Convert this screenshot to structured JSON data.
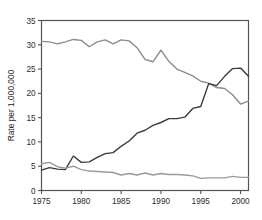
{
  "chart_data": {
    "type": "line",
    "title": "",
    "xlabel": "",
    "ylabel": "Rate per 1,000,000",
    "xlim": [
      1975,
      2001
    ],
    "ylim": [
      0,
      35
    ],
    "grid": false,
    "legend": "none",
    "x_ticks": [
      "1975",
      "1980",
      "1985",
      "1990",
      "1995",
      "2000"
    ],
    "x_tick_values": [
      1975,
      1980,
      1985,
      1990,
      1995,
      2000
    ],
    "y_ticks": [
      "0",
      "5",
      "10",
      "15",
      "20",
      "25",
      "30",
      "35"
    ],
    "y_tick_values": [
      0,
      5,
      10,
      15,
      20,
      25,
      30,
      35
    ],
    "x": [
      1975,
      1976,
      1977,
      1978,
      1979,
      1980,
      1981,
      1982,
      1983,
      1984,
      1985,
      1986,
      1987,
      1988,
      1989,
      1990,
      1991,
      1992,
      1993,
      1994,
      1995,
      1996,
      1997,
      1998,
      1999,
      2000,
      2001
    ],
    "series": [
      {
        "name": "declining-upper-series",
        "color": "#8c8c8c",
        "values": [
          30.7,
          30.6,
          30.2,
          30.6,
          31.1,
          30.9,
          29.6,
          30.6,
          31.0,
          30.2,
          31.0,
          30.8,
          29.4,
          27.0,
          26.5,
          28.9,
          26.6,
          25.0,
          24.3,
          23.6,
          22.5,
          22.1,
          21.2,
          21.0,
          19.7,
          17.8,
          18.4
        ]
      },
      {
        "name": "rising-series",
        "color": "#3a3a3a",
        "values": [
          4.2,
          4.7,
          4.4,
          4.3,
          7.1,
          5.8,
          5.9,
          6.8,
          7.6,
          7.8,
          9.1,
          10.2,
          11.8,
          12.4,
          13.4,
          14.0,
          14.8,
          14.8,
          15.1,
          16.9,
          17.3,
          22.0,
          21.6,
          23.5,
          25.1,
          25.2,
          23.5
        ]
      },
      {
        "name": "low-flat-series",
        "color": "#9a9a9a",
        "values": [
          5.5,
          5.8,
          4.9,
          4.6,
          5.0,
          4.3,
          4.0,
          3.9,
          3.8,
          3.7,
          3.2,
          3.5,
          3.2,
          3.6,
          3.2,
          3.5,
          3.3,
          3.3,
          3.2,
          3.0,
          2.5,
          2.6,
          2.6,
          2.6,
          2.9,
          2.7,
          2.7
        ]
      }
    ]
  },
  "axes": {
    "ylabel": "Rate per 1,000,000"
  }
}
